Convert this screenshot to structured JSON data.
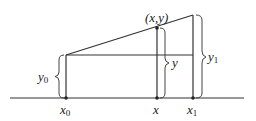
{
  "diagram": {
    "type": "linear-interpolation",
    "labels": {
      "point": "(x,y)",
      "x0": "x",
      "x0_sub": "0",
      "x": "x",
      "x1": "x",
      "x1_sub": "1",
      "y0": "y",
      "y0_sub": "0",
      "y": "y",
      "y1": "y",
      "y1_sub": "1"
    },
    "points": {
      "x0": [
        66,
        98
      ],
      "top_x0": [
        66,
        55
      ],
      "xy": [
        157,
        28
      ],
      "x1": [
        193,
        98
      ],
      "top_x1": [
        193,
        15
      ]
    },
    "colors": {
      "line": "#333333",
      "background": "#ffffff"
    }
  }
}
